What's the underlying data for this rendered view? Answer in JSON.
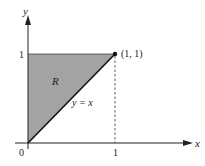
{
  "diagram": {
    "type": "region-plot",
    "axes": {
      "x_label": "x",
      "y_label": "y",
      "origin_label": "0",
      "x_tick_label": "1",
      "y_tick_label": "1"
    },
    "region": {
      "label": "R",
      "vertices": [
        [
          0,
          0
        ],
        [
          0,
          1
        ],
        [
          1,
          1
        ]
      ],
      "fill_color": "#a3a3a3"
    },
    "line": {
      "label": "y = x",
      "from": [
        0,
        0
      ],
      "to": [
        1,
        1
      ]
    },
    "point": {
      "label": "(1, 1)",
      "x": 1,
      "y": 1
    },
    "guide": {
      "style": "dashed",
      "from": [
        1,
        1
      ],
      "to": [
        1,
        0
      ]
    }
  }
}
